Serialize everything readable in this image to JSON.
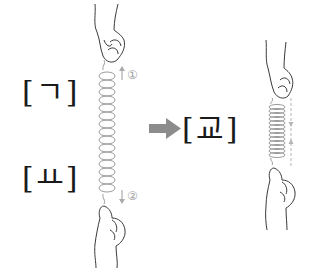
{
  "diagram": {
    "left_top_label": "[ㄱ]",
    "left_bottom_label": "[ㅛ]",
    "result_label": "[교]",
    "step_1_marker": "①",
    "step_2_marker": "②",
    "arrow_color": "#8c8c8c",
    "spring_color": "#9a9a9a",
    "line_color": "#3a3a3a"
  }
}
